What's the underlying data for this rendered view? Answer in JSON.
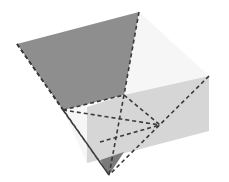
{
  "diagram": {
    "type": "3d-geometric-solid",
    "colors": {
      "dark_face": "#8e8e8e",
      "light_face": "#d6d6d6",
      "white_face": "#f6f6f6",
      "tip_face": "#7a7a7a",
      "edge": "#3a3a3a",
      "background": "#ffffff"
    },
    "points": {
      "A": [
        17,
        44
      ],
      "B": [
        139,
        12
      ],
      "C": [
        124,
        95
      ],
      "D": [
        63,
        110
      ],
      "E": [
        209,
        76
      ],
      "F": [
        209,
        131
      ],
      "G": [
        87,
        163
      ],
      "H": [
        87,
        107
      ],
      "X": [
        160,
        125
      ],
      "I": [
        117,
        137
      ],
      "J": [
        100,
        142
      ],
      "K": [
        109,
        175
      ]
    }
  }
}
